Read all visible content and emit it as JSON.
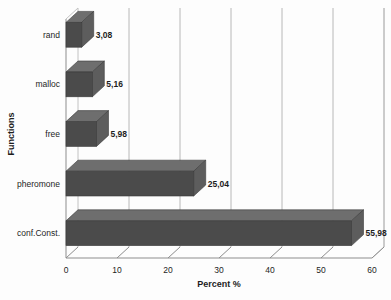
{
  "chart_data": {
    "type": "bar",
    "orientation": "horizontal",
    "style": "3d",
    "title": "",
    "xlabel": "Percent %",
    "ylabel": "Functions",
    "categories": [
      "rand",
      "malloc",
      "free",
      "pheromone",
      "conf.Const."
    ],
    "values": [
      3.08,
      5.16,
      5.98,
      25.04,
      55.98
    ],
    "value_labels": [
      "3,08",
      "5,16",
      "5,98",
      "25,04",
      "55,98"
    ],
    "xlim": [
      0,
      60
    ],
    "xticks": [
      0,
      10,
      20,
      30,
      40,
      50,
      60
    ],
    "xtick_labels": [
      "0",
      "10",
      "20",
      "30",
      "40",
      "50",
      "60"
    ],
    "grid": "vertical",
    "legend": "none",
    "decimal_separator": ",",
    "series": [
      {
        "name": "Percent %",
        "values": [
          3.08,
          5.16,
          5.98,
          25.04,
          55.98
        ]
      }
    ],
    "colors": {
      "bar_front": "#4b4b4b",
      "bar_top": "#6e6e6e",
      "bar_side": "#5d5d5d",
      "grid": "#b8b8b8",
      "axis": "#8d8d8d",
      "text": "#1d1d1d",
      "background": "#fdfdfd"
    }
  }
}
